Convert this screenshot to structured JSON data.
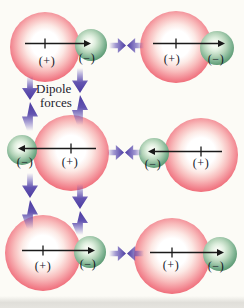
{
  "figure": {
    "type": "chemistry-diagram",
    "annotation": {
      "line1": "Dipole",
      "line2": "forces"
    },
    "colors": {
      "positive_sphere": "#ea4f5f",
      "negative_sphere": "#4f8a66",
      "force_arrow": "#4b3ba2",
      "dipole_arrow": "#1a1a1a",
      "background": "#fcfbf6"
    }
  },
  "molecules": [
    {
      "position": "top-left",
      "dipole_direction": "right",
      "positive_label": "(+)",
      "negative_label": "(−)"
    },
    {
      "position": "top-right",
      "dipole_direction": "right",
      "positive_label": "(+)",
      "negative_label": "(−)"
    },
    {
      "position": "middle-left",
      "dipole_direction": "left",
      "positive_label": "(+)",
      "negative_label": "(−)"
    },
    {
      "position": "middle-right",
      "dipole_direction": "left",
      "positive_label": "(+)",
      "negative_label": "(−)"
    },
    {
      "position": "bottom-left",
      "dipole_direction": "right",
      "positive_label": "(+)",
      "negative_label": "(−)"
    },
    {
      "position": "bottom-right",
      "dipole_direction": "right",
      "positive_label": "(+)",
      "negative_label": "(−)"
    }
  ],
  "force_arrows": {
    "horizontal_converging_pairs": 3,
    "vertical_converging_pairs": 4,
    "meaning": "attraction between (+) end of one dipole and (−) end of neighbor"
  }
}
